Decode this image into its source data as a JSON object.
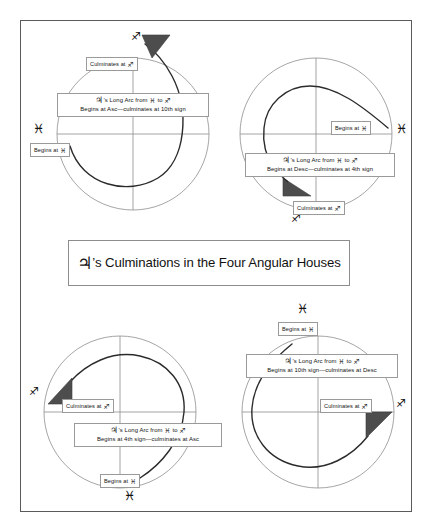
{
  "figure": {
    "title_jupiter_glyph": "♃",
    "title_text": "’s Culminations in the Four Angular Houses",
    "frame_color": "#5a5a5a",
    "arc_color": "#222222",
    "wheel_color": "#8e8e8e",
    "arrow_fill": "#4d4d4d"
  },
  "glyphs": {
    "jupiter": "♃",
    "pisces": "♓",
    "sagittarius": "♐"
  },
  "panels": [
    {
      "id": "top-left",
      "arc_line1_prefix": "’s Long Arc from ",
      "arc_line1_from": "♓",
      "arc_line1_mid": " to ",
      "arc_line1_to": "♐",
      "arc_line2": "Begins at Asc—culminates at 10th sign",
      "begins_label": "Begins at ",
      "begins_glyph": "♓",
      "culminates_label": "Culminates at ",
      "culminates_glyph": "♐",
      "outer_glyph": "♓",
      "outer_glyph_2": "♐"
    },
    {
      "id": "top-right",
      "arc_line1_prefix": "’s Long Arc from ",
      "arc_line1_from": "♓",
      "arc_line1_mid": " to ",
      "arc_line1_to": "♐",
      "arc_line2": "Begins at Desc—culminates at 4th sign",
      "begins_label": "Begins at ",
      "begins_glyph": "♓",
      "culminates_label": "Culminates at ",
      "culminates_glyph": "♐",
      "outer_glyph": "♓",
      "outer_glyph_2": "♐"
    },
    {
      "id": "bottom-left",
      "arc_line1_prefix": "’s Long Arc from ",
      "arc_line1_from": "♓",
      "arc_line1_mid": " to ",
      "arc_line1_to": "♐",
      "arc_line2": "Begins at 4th sign—culminates at Asc",
      "begins_label": "Begins at ",
      "begins_glyph": "♓",
      "culminates_label": "Culminates at ",
      "culminates_glyph": "♐",
      "outer_glyph": "♓",
      "outer_glyph_2": "♐"
    },
    {
      "id": "bottom-right",
      "arc_line1_prefix": "’s Long Arc from ",
      "arc_line1_from": "♓",
      "arc_line1_mid": " to ",
      "arc_line1_to": "♐",
      "arc_line2": "Begins at 10th sign—culminates at Desc",
      "begins_label": "Begins at ",
      "begins_glyph": "♓",
      "culminates_label": "Culminates at ",
      "culminates_glyph": "♐",
      "outer_glyph": "♓",
      "outer_glyph_2": "♐"
    }
  ]
}
